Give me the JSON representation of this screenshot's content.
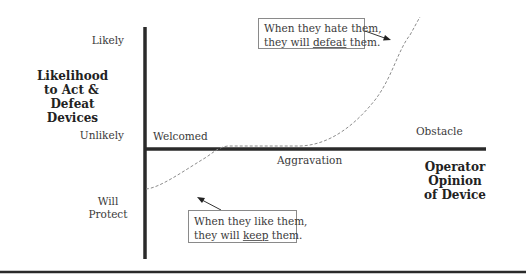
{
  "y_axis": {
    "title_lines": [
      "Likelihood",
      "to Act &",
      "Defeat Devices"
    ],
    "tick_top": "Likely",
    "tick_middle": "Unlikely",
    "tick_bottom_lines": [
      "Will",
      "Protect"
    ]
  },
  "x_axis": {
    "title_lines": [
      "Operator Opinion",
      "of Device"
    ],
    "labels": {
      "left": "Welcomed",
      "middle": "Aggravation",
      "right": "Obstacle"
    }
  },
  "callouts": {
    "top": {
      "line1": "When they hate them,",
      "line2_prefix": "they will ",
      "line2_emph": "defeat",
      "line2_suffix": " them."
    },
    "bottom": {
      "line1": "When they like them,",
      "line2_prefix": "they will ",
      "line2_emph": "keep",
      "line2_suffix": " them."
    }
  },
  "colors": {
    "axis": "#2a2a2a",
    "curve": "#8c8c8c",
    "text": "#3a3a3a"
  }
}
